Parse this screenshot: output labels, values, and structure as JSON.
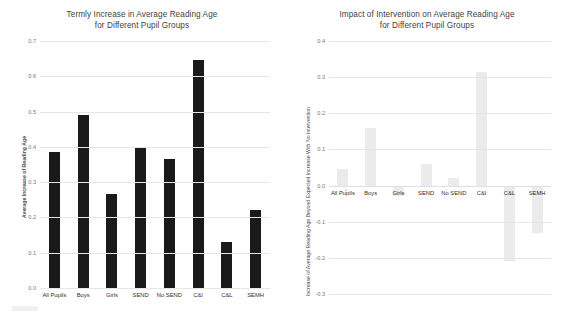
{
  "chart_data": [
    {
      "type": "bar",
      "title": "Termly Increase in Average Reading Age for Different Pupil Groups",
      "title_line1": "Termly Increase in Average Reading Age",
      "title_line2": "for Different Pupil Groups",
      "xlabel": "",
      "ylabel": "Average Increase of Reading Age",
      "categories": [
        "All Pupils",
        "Boys",
        "Girls",
        "SEND",
        "No SEND",
        "C&I",
        "C&L",
        "SEMH"
      ],
      "values": [
        0.385,
        0.49,
        0.265,
        0.4,
        0.365,
        0.645,
        0.13,
        0.22
      ],
      "ylim": [
        0.0,
        0.7
      ],
      "yticks": [
        "0.7",
        "0.6",
        "0.5",
        "0.4",
        "0.3",
        "0.2",
        "0.1",
        "0.0"
      ],
      "ytick_values": [
        0.7,
        0.6,
        0.5,
        0.4,
        0.3,
        0.2,
        0.1,
        0.0
      ],
      "grid": true,
      "legend": false,
      "bar_color": "#1a1a1a"
    },
    {
      "type": "bar",
      "title": "Impact of Intervention on Average Reading Age for Different Pupil Groups",
      "title_line1": "Impact of Intervention on Average Reading Age",
      "title_line2": "for Different Pupil Groups",
      "xlabel": "",
      "ylabel": "Increase of Average Reading Age Beyond Expected Increase With No Intervention",
      "categories": [
        "All Pupils",
        "Boys",
        "Girls",
        "SEND",
        "No SEND",
        "C&I",
        "C&L",
        "SEMH"
      ],
      "values": [
        0.045,
        0.16,
        -0.03,
        0.06,
        0.02,
        0.315,
        -0.21,
        -0.13
      ],
      "ylim": [
        -0.3,
        0.4
      ],
      "yticks": [
        "0.4",
        "0.3",
        "0.2",
        "0.1",
        "0.0",
        "-0.1",
        "-0.2",
        "-0.3"
      ],
      "ytick_values": [
        0.4,
        0.3,
        0.2,
        0.1,
        0.0,
        -0.1,
        -0.2,
        -0.3
      ],
      "grid": true,
      "legend": false,
      "bar_color": "#ebebeb"
    }
  ]
}
